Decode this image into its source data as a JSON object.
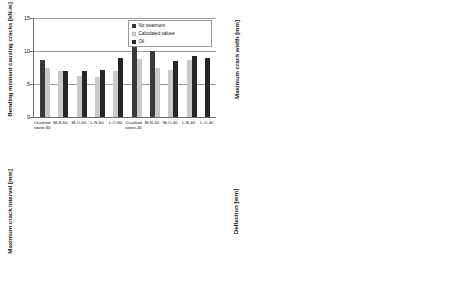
{
  "chart_data": [
    {
      "panel": "top-left",
      "type": "bar",
      "title": "",
      "ylabel": "Bending moment causing cracks [kN.m]",
      "xlabel": "",
      "ylim": [
        0,
        15
      ],
      "yticks": [
        0,
        5,
        10,
        15
      ],
      "grid": true,
      "legend_position": "top-right",
      "categories": [
        "Crushed stone-60",
        "M-N-60",
        "M-O-60",
        "L-N-60",
        "L-O-60",
        "Crushed stone-40",
        "M-N-40",
        "M-O-40",
        "L-N-40",
        "L-O-40"
      ],
      "series": [
        {
          "name": "No treatment",
          "values": [
            8.7,
            null,
            null,
            null,
            null,
            13.5,
            10.0,
            null,
            null,
            null
          ]
        },
        {
          "name": "Calculated values",
          "values": [
            7.5,
            7.0,
            6.2,
            6.1,
            7.0,
            8.8,
            7.5,
            7.1,
            8.7,
            null
          ]
        },
        {
          "name": "Oil",
          "values": [
            null,
            7.0,
            7.0,
            7.1,
            9.0,
            null,
            null,
            8.5,
            9.2,
            9.0
          ]
        }
      ]
    },
    {
      "panel": "top-right",
      "type": "bar",
      "title": "",
      "ylabel": "Maximum crack width [mm]",
      "xlabel": "",
      "ylim": [
        0,
        0.3
      ],
      "yticks": [
        0,
        0.1,
        0.2,
        0.3
      ],
      "grid": true,
      "legend_position": "top-right",
      "categories": [
        "Crushed stone-60",
        "M-60",
        "L-60",
        "Crushed stone-40",
        "M-40",
        "L-40"
      ],
      "series": [
        {
          "name": "No treatment",
          "values": [
            0.135,
            0.198,
            0.163,
            0.136,
            0.166,
            0.175
          ]
        },
        {
          "name": "Oil",
          "values": [
            null,
            0.193,
            0.153,
            null,
            0.165,
            0.158
          ]
        }
      ]
    },
    {
      "panel": "bottom-left",
      "type": "bar",
      "title": "",
      "ylabel": "Maximum crack interval [mm]",
      "xlabel": "",
      "ylim": [
        0,
        300
      ],
      "yticks": [
        0,
        100,
        200,
        300
      ],
      "grid": true,
      "legend_position": "top-right",
      "categories": [
        "Crushed stone-60",
        "M-60",
        "L-60",
        "Crushed stone-40",
        "M-40",
        "L-40"
      ],
      "series": [
        {
          "name": "No treatment",
          "values": [
            186,
            137,
            110,
            165,
            120,
            112
          ]
        },
        {
          "name": "Oil",
          "values": [
            null,
            130,
            97,
            null,
            107,
            107
          ]
        }
      ]
    },
    {
      "panel": "bottom-right",
      "type": "bar",
      "title": "",
      "ylabel": "Deflection [mm]",
      "xlabel": "",
      "ylim": [
        0,
        3
      ],
      "yticks": [
        0,
        1,
        2,
        3
      ],
      "grid": true,
      "legend_position": "top-right",
      "categories": [
        "Crushed stone-60",
        "M-60",
        "L-60",
        "Crushed stone-40",
        "M-40",
        "L-40"
      ],
      "series": [
        {
          "name": "No treatment",
          "values": [
            1.78,
            1.92,
            1.92,
            1.4,
            1.5,
            1.37
          ]
        },
        {
          "name": "Oil",
          "values": [
            null,
            2.0,
            1.9,
            null,
            1.34,
            1.6
          ]
        }
      ]
    }
  ],
  "panels": {
    "top_left": {
      "ylabel": "Bending moment causing cracks [kN.m]",
      "yticks": [
        "15",
        "10",
        "5",
        "0"
      ],
      "xlabels": [
        "Crushed\nstone-60",
        "M-N-60",
        "M-O-60",
        "L-N-60",
        "L-O-60",
        "Crushed\nstone-40",
        "M-N-40",
        "M-O-40",
        "L-N-40",
        "L-O-40"
      ],
      "legend": [
        "No treatment",
        "Calculated values",
        "Oil"
      ]
    },
    "top_right": {
      "ylabel": "Maximum crack width [mm]",
      "yticks": [
        "0.3",
        "0.2",
        "0.1",
        "0"
      ],
      "xlabels": [
        "Crushed\nstone-60",
        "M-60",
        "L-60",
        "Crushed\nstone-40",
        "M-40",
        "L-40"
      ],
      "legend": [
        "No treatment",
        "Oil"
      ]
    },
    "bottom_left": {
      "ylabel": "Maximum crack interval [mm]",
      "yticks": [
        "300",
        "200",
        "100",
        "0"
      ],
      "xlabels": [
        "Crushed\nstone-60",
        "M-60",
        "L-60",
        "Crushed\nstone-40",
        "M-40",
        "L-40"
      ],
      "legend": [
        "No treatment",
        "Oil"
      ]
    },
    "bottom_right": {
      "ylabel": "Deflection [mm]",
      "yticks": [
        "3",
        "2",
        "1",
        "0"
      ],
      "xlabels": [
        "Crushed\nstone-60",
        "M-60",
        "L-60",
        "Crushed\nstone-40",
        "M-40",
        "L-40"
      ],
      "legend": [
        "No treatment",
        "Oil"
      ]
    }
  },
  "colors": {
    "series_no_treatment": "#3a3a3a",
    "series_calculated": "#c9c9c9",
    "series_oil": "#272727",
    "gridline": "#9d9d9d",
    "axis": "#6e6e6e"
  }
}
